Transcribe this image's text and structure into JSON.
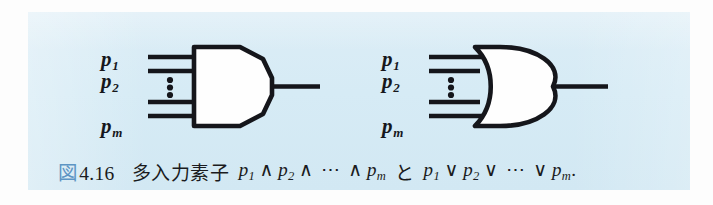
{
  "figure": {
    "panel_bg_color": "#d8ecf5",
    "ink_color": "#16171c",
    "accent_color": "#5d95c4"
  },
  "caption": {
    "number_kanji": "図",
    "number": "4.16",
    "jp_text": "多入力素子",
    "conjunction": "と",
    "period": ".",
    "var_name": "p",
    "sub_1": "1",
    "sub_2": "2",
    "sub_m": "m",
    "and_op": "∧",
    "or_op": "∨",
    "ellipsis": "⋯"
  },
  "and_gate": {
    "name": "AND gate",
    "symbol": "∧",
    "inputs": [
      {
        "label_var": "p",
        "label_sub": "1",
        "has_label": true
      },
      {
        "label_var": "p",
        "label_sub": "2",
        "has_label": true
      },
      {
        "label_var": "",
        "label_sub": "",
        "has_label": false
      },
      {
        "label_var": "p",
        "label_sub": "m",
        "has_label": true
      }
    ],
    "input_count_shown": 4,
    "ellipsis_dots": 3,
    "output_count": 1
  },
  "or_gate": {
    "name": "OR gate",
    "symbol": "∨",
    "inputs": [
      {
        "label_var": "p",
        "label_sub": "1",
        "has_label": true
      },
      {
        "label_var": "p",
        "label_sub": "2",
        "has_label": true
      },
      {
        "label_var": "",
        "label_sub": "",
        "has_label": false
      },
      {
        "label_var": "p",
        "label_sub": "m",
        "has_label": true
      }
    ],
    "input_count_shown": 4,
    "ellipsis_dots": 3,
    "output_count": 1
  }
}
